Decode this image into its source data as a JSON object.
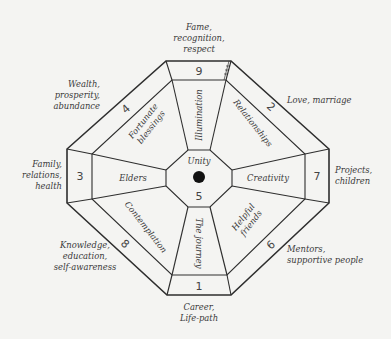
{
  "diagram": {
    "type": "bagua-octagon",
    "center": {
      "label": "Unity",
      "number": "5"
    },
    "colors": {
      "line": "#2e2e2e",
      "background": "#f4f4f2",
      "text": "#3a3a3a",
      "dot": "#111111"
    },
    "sectors": [
      {
        "number": "9",
        "area": "Illumination",
        "outer_label": "Fame,\nrecognition,\nrespect"
      },
      {
        "number": "2",
        "area": "Relationships",
        "outer_label": "Love, marriage"
      },
      {
        "number": "7",
        "area": "Creativity",
        "outer_label": "Projects,\nchildren"
      },
      {
        "number": "6",
        "area": "Helpful\nfriends",
        "outer_label": "Mentors,\nsupportive people"
      },
      {
        "number": "1",
        "area": "The journey",
        "outer_label": "Career,\nLife-path"
      },
      {
        "number": "8",
        "area": "Contemplation",
        "outer_label": "Knowledge,\neducation,\nself-awareness"
      },
      {
        "number": "3",
        "area": "Elders",
        "outer_label": "Family,\nrelations,\nhealth"
      },
      {
        "number": "4",
        "area": "Fortunate\nblessings",
        "outer_label": "Wealth,\nprosperity,\nabundance"
      }
    ]
  }
}
